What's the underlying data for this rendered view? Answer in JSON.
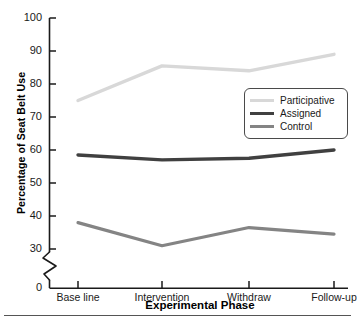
{
  "chart_data": {
    "type": "line",
    "title": "",
    "xlabel": "Experimental Phase",
    "ylabel": "Percentage of Seat Belt Use",
    "categories": [
      "Base line",
      "Intervention",
      "Withdraw",
      "Follow-up"
    ],
    "yticks": [
      0,
      30,
      40,
      50,
      60,
      70,
      80,
      90,
      100
    ],
    "ylim": [
      30,
      100
    ],
    "y_axis_break": true,
    "y_axis_break_between": [
      0,
      30
    ],
    "grid": false,
    "legend_position": "center-right",
    "series": [
      {
        "name": "Participative",
        "color": "#d8d8d8",
        "values": [
          75,
          85.5,
          84,
          89
        ]
      },
      {
        "name": "Assigned",
        "color": "#404040",
        "values": [
          58.5,
          57,
          57.5,
          60
        ]
      },
      {
        "name": "Control",
        "color": "#848484",
        "values": [
          38,
          31,
          36.5,
          34.5
        ]
      }
    ]
  },
  "axis": {
    "ytick_labels": [
      "100",
      "90",
      "80",
      "70",
      "60",
      "50",
      "40",
      "30",
      "0"
    ],
    "xtick_labels": [
      "Base line",
      "Intervention",
      "Withdraw",
      "Follow-up"
    ],
    "y_title": "Percentage of Seat Belt Use",
    "x_title": "Experimental Phase"
  },
  "legend": {
    "entries": [
      {
        "label": "Participative",
        "color": "#d8d8d8"
      },
      {
        "label": "Assigned",
        "color": "#404040"
      },
      {
        "label": "Control",
        "color": "#848484"
      }
    ]
  },
  "colors": {
    "axis": "#1a1a1a",
    "participative": "#d8d8d8",
    "assigned": "#404040",
    "control": "#848484",
    "legend_border": "#4a4a4a",
    "rule": "#555555"
  }
}
